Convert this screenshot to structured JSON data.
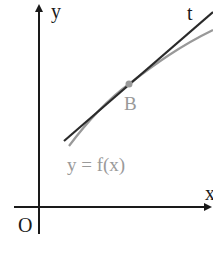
{
  "diagram": {
    "axes": {
      "x_label": "x",
      "y_label": "y",
      "origin_label": "O"
    },
    "tangent_label": "t",
    "point_label": "B",
    "curve_label": "y = f(x)",
    "colors": {
      "axis": "#1a1a1a",
      "tangent": "#2a2a2a",
      "curve": "#999999",
      "point": "#999999",
      "curve_label": "#9a9a9a"
    }
  }
}
